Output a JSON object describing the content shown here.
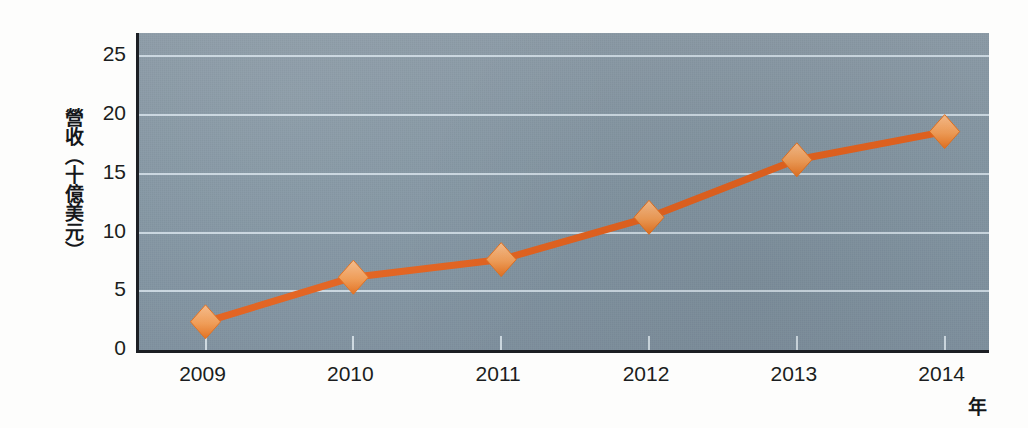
{
  "chart_data": {
    "type": "line",
    "title": "",
    "xlabel": "年",
    "ylabel": "營收（十億美元）",
    "categories": [
      "2009",
      "2010",
      "2011",
      "2012",
      "2013",
      "2014"
    ],
    "x": [
      2009,
      2010,
      2011,
      2012,
      2013,
      2014
    ],
    "values": [
      2.4,
      6.2,
      7.7,
      11.3,
      16.2,
      18.6
    ],
    "series": [
      {
        "name": "營收",
        "values": [
          2.4,
          6.2,
          7.7,
          11.3,
          16.2,
          18.6
        ]
      }
    ],
    "yticks": [
      0,
      5,
      10,
      15,
      20,
      25
    ],
    "ytick_labels": [
      "0",
      "5",
      "10",
      "15",
      "20",
      "25"
    ],
    "ylim": [
      0,
      27
    ],
    "xlim": [
      2008.55,
      2014.3
    ],
    "grid": true,
    "grid_color": "#cfdbe4",
    "legend": "none",
    "marker": "diamond",
    "line_color": "#e2621f",
    "marker_color": "#f0a465",
    "plot_background": "#8496a3",
    "axis_color": "#1c1f24"
  },
  "axes": {
    "y_title": "營收（十億美元）",
    "x_title": "年"
  }
}
